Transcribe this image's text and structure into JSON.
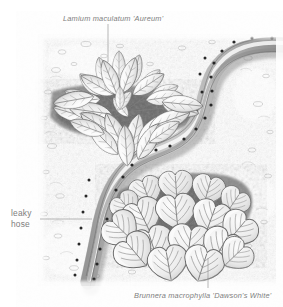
{
  "figure": {
    "kind": "botanical-garden-illustration",
    "style": "graphite pencil drawing, monochrome grayscale",
    "width": 283,
    "height": 307,
    "background_color": "#ffffff"
  },
  "labels": {
    "top_plant": {
      "text": "Lamium maculatum 'Aureum'",
      "style": "italic",
      "color": "#7d7d7d",
      "x": 63,
      "y": 14,
      "leader": {
        "type": "vertical-line",
        "x": 108,
        "y1": 24,
        "y2": 62
      }
    },
    "bottom_plant": {
      "text": "Brunnera macrophylla 'Dawson's White'",
      "style": "italic",
      "color": "#7d7d7d",
      "x": 134,
      "y": 291,
      "leader": {
        "type": "vertical-line",
        "x": 208,
        "y1": 258,
        "y2": 288
      }
    },
    "hose": {
      "line1": "leaky",
      "line2": "hose",
      "style": "regular",
      "color": "#7d7d7d",
      "x": 11,
      "y": 208,
      "leader": {
        "type": "horizontal-line",
        "y": 219,
        "x1": 40,
        "x2": 92
      }
    }
  },
  "scene": {
    "soil_color": "#6e6e6e",
    "mulch_color": "#d7d7d7",
    "leaf_light": "#f2f2f2",
    "leaf_outline": "#6b6b6b",
    "hose_color": "#b8b8b8",
    "hose_shadow": "#8a8a8a",
    "emitter_dot_color": "#2b2b2b"
  },
  "elements": {
    "lamium_plant": {
      "name": "Lamium maculatum 'Aureum'",
      "common_form": "low spreading rosette of pointed lance-shaped variegated leaves",
      "position": "upper-left bed",
      "leaf_count_visible": 34
    },
    "brunnera_plant": {
      "name": "Brunnera macrophylla 'Dawson's White'",
      "common_form": "clump of broad heart-shaped leaves with radiating veins and white margins",
      "position": "lower-right bed",
      "leaf_count_visible": 17
    },
    "leaky_hose": {
      "name": "leaky hose",
      "description": "perforated soaker hose laid in an S-curve between the two planting beds",
      "path": "enters top-right, curves left and down through an S-bend, exits bottom-left",
      "emitter_dots_visible": 34
    }
  }
}
